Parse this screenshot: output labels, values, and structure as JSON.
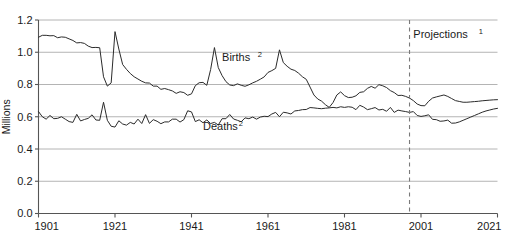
{
  "chart_data": {
    "type": "line",
    "title": "",
    "subtitle": "",
    "xlabel": "",
    "ylabel": "Millions",
    "xlim": [
      1901,
      2021
    ],
    "ylim": [
      0.0,
      1.2
    ],
    "grid": true,
    "legend_position": "inline-annotations",
    "x_ticks": [
      "1901",
      "1921",
      "1941",
      "1961",
      "1981",
      "2001",
      "2021"
    ],
    "x_tick_values": [
      1901,
      1921,
      1941,
      1961,
      1981,
      2001,
      2021
    ],
    "y_ticks": [
      "0.0",
      "0.2",
      "0.4",
      "0.6",
      "0.8",
      "1.0",
      "1.2"
    ],
    "y_tick_values": [
      0.0,
      0.2,
      0.4,
      0.6,
      0.8,
      1.0,
      1.2
    ],
    "annotations": [
      {
        "name": "births-label",
        "text": "Births",
        "superscript": "2",
        "x": 1949,
        "y": 0.945
      },
      {
        "name": "deaths-label",
        "text": "Deaths",
        "superscript": "2",
        "x": 1944,
        "y": 0.515
      },
      {
        "name": "projections-label",
        "text": "Projections",
        "superscript": "1",
        "x": 1999,
        "y": 1.09
      }
    ],
    "projection_divider": {
      "x": 1998,
      "style": "dashed",
      "color": "#7a7a7a"
    },
    "line_color": "#2b2b2b",
    "grid_color": "#b4b4b4",
    "axis_color": "#6e6e6e",
    "x": [
      1901,
      1902,
      1903,
      1904,
      1905,
      1906,
      1907,
      1908,
      1909,
      1910,
      1911,
      1912,
      1913,
      1914,
      1915,
      1916,
      1917,
      1918,
      1919,
      1920,
      1921,
      1922,
      1923,
      1924,
      1925,
      1926,
      1927,
      1928,
      1929,
      1930,
      1931,
      1932,
      1933,
      1934,
      1935,
      1936,
      1937,
      1938,
      1939,
      1940,
      1941,
      1942,
      1943,
      1944,
      1945,
      1946,
      1947,
      1948,
      1949,
      1950,
      1951,
      1952,
      1953,
      1954,
      1955,
      1956,
      1957,
      1958,
      1959,
      1960,
      1961,
      1962,
      1963,
      1964,
      1965,
      1966,
      1967,
      1968,
      1969,
      1970,
      1971,
      1972,
      1973,
      1974,
      1975,
      1976,
      1977,
      1978,
      1979,
      1980,
      1981,
      1982,
      1983,
      1984,
      1985,
      1986,
      1987,
      1988,
      1989,
      1990,
      1991,
      1992,
      1993,
      1994,
      1995,
      1996,
      1997,
      1998,
      1999,
      2000,
      2001,
      2002,
      2003,
      2004,
      2005,
      2006,
      2007,
      2008,
      2009,
      2010,
      2011,
      2012,
      2013,
      2014,
      2015,
      2016,
      2017,
      2018,
      2019,
      2020,
      2021
    ],
    "series": [
      {
        "name": "Births",
        "values": [
          1.093,
          1.105,
          1.105,
          1.102,
          1.103,
          1.09,
          1.095,
          1.093,
          1.083,
          1.073,
          1.058,
          1.06,
          1.055,
          1.038,
          1.029,
          1.03,
          1.028,
          0.848,
          0.79,
          0.81,
          1.128,
          1.02,
          0.924,
          0.894,
          0.868,
          0.848,
          0.834,
          0.82,
          0.81,
          0.809,
          0.79,
          0.79,
          0.77,
          0.775,
          0.768,
          0.76,
          0.745,
          0.755,
          0.75,
          0.733,
          0.742,
          0.793,
          0.811,
          0.813,
          0.795,
          0.893,
          1.029,
          0.905,
          0.855,
          0.818,
          0.797,
          0.793,
          0.804,
          0.795,
          0.789,
          0.798,
          0.81,
          0.82,
          0.833,
          0.847,
          0.875,
          0.886,
          0.9,
          1.015,
          0.936,
          0.913,
          0.895,
          0.887,
          0.87,
          0.848,
          0.832,
          0.784,
          0.735,
          0.71,
          0.697,
          0.675,
          0.658,
          0.688,
          0.735,
          0.754,
          0.731,
          0.719,
          0.721,
          0.73,
          0.751,
          0.755,
          0.776,
          0.788,
          0.777,
          0.799,
          0.792,
          0.781,
          0.762,
          0.75,
          0.732,
          0.733,
          0.726,
          0.716,
          0.7,
          0.679,
          0.669,
          0.668,
          0.696,
          0.716,
          0.723,
          0.729,
          0.735,
          0.726,
          0.713,
          0.7,
          0.695,
          0.69,
          0.69,
          0.692,
          0.694,
          0.696,
          0.699,
          0.701,
          0.703,
          0.705,
          0.706
        ]
      },
      {
        "name": "Deaths",
        "values": [
          0.632,
          0.6,
          0.585,
          0.608,
          0.588,
          0.59,
          0.6,
          0.585,
          0.57,
          0.565,
          0.615,
          0.574,
          0.583,
          0.59,
          0.612,
          0.58,
          0.578,
          0.69,
          0.578,
          0.541,
          0.536,
          0.575,
          0.555,
          0.548,
          0.565,
          0.555,
          0.585,
          0.558,
          0.613,
          0.559,
          0.582,
          0.572,
          0.557,
          0.568,
          0.568,
          0.585,
          0.585,
          0.567,
          0.582,
          0.637,
          0.63,
          0.57,
          0.581,
          0.563,
          0.58,
          0.558,
          0.565,
          0.549,
          0.588,
          0.588,
          0.614,
          0.586,
          0.578,
          0.569,
          0.593,
          0.588,
          0.598,
          0.585,
          0.598,
          0.603,
          0.601,
          0.617,
          0.627,
          0.6,
          0.628,
          0.624,
          0.617,
          0.636,
          0.639,
          0.644,
          0.645,
          0.657,
          0.655,
          0.652,
          0.65,
          0.653,
          0.655,
          0.658,
          0.655,
          0.662,
          0.658,
          0.662,
          0.659,
          0.644,
          0.671,
          0.66,
          0.644,
          0.65,
          0.657,
          0.642,
          0.646,
          0.634,
          0.658,
          0.627,
          0.641,
          0.636,
          0.632,
          0.627,
          0.632,
          0.608,
          0.602,
          0.606,
          0.612,
          0.584,
          0.582,
          0.572,
          0.574,
          0.579,
          0.56,
          0.561,
          0.568,
          0.578,
          0.588,
          0.598,
          0.608,
          0.618,
          0.628,
          0.636,
          0.642,
          0.648,
          0.652
        ]
      }
    ]
  }
}
